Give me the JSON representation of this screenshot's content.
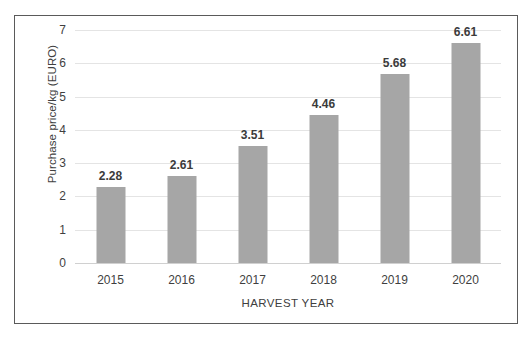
{
  "chart_data": {
    "type": "bar",
    "title": "",
    "xlabel": "HARVEST YEAR",
    "ylabel": "Purchase price/kg (EURO)",
    "categories": [
      "2015",
      "2016",
      "2017",
      "2018",
      "2019",
      "2020"
    ],
    "values": [
      2.28,
      2.61,
      3.51,
      4.46,
      5.68,
      6.61
    ],
    "value_labels": [
      "2.28",
      "2.61",
      "3.51",
      "4.46",
      "5.68",
      "6.61"
    ],
    "ylim": [
      0,
      7
    ],
    "yticks": [
      "0",
      "1",
      "2",
      "3",
      "4",
      "5",
      "6",
      "7"
    ],
    "ytick_values": [
      0,
      1,
      2,
      3,
      4,
      5,
      6,
      7
    ],
    "grid": true,
    "legend": "none",
    "bar_color": "#a6a6a6",
    "gridline_color": "#e4e4e4",
    "frame_color": "#5a5a5a",
    "background_color": "#ffffff"
  }
}
